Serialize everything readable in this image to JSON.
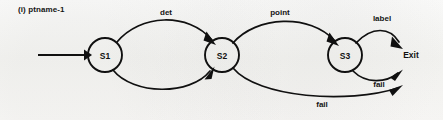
{
  "figure": {
    "caption": "(i) ptname-1",
    "background_color": "#fbfbf9",
    "ink_color": "#101010"
  },
  "diagram": {
    "type": "state-transition-diagram",
    "states": [
      {
        "id": "S1",
        "label": "S1",
        "cx": 105,
        "cy": 55,
        "r": 17
      },
      {
        "id": "S2",
        "label": "S2",
        "cx": 222,
        "cy": 55,
        "r": 17
      },
      {
        "id": "S3",
        "label": "S3",
        "cx": 345,
        "cy": 55,
        "r": 17
      }
    ],
    "terminals": [
      {
        "id": "Exit",
        "label": "Exit",
        "x": 411,
        "y": 58
      }
    ],
    "start_arrow": {
      "from_x": 38,
      "to_x": 86,
      "y": 55
    },
    "transitions": [
      {
        "id": "t1",
        "from": "S1",
        "to": "S2",
        "label": "det",
        "label_x": 166,
        "label_y": 15,
        "style": "arc-over"
      },
      {
        "id": "t2",
        "from": "S1",
        "to": "S2",
        "label": "",
        "label_x": 0,
        "label_y": 0,
        "style": "arc-under"
      },
      {
        "id": "t3",
        "from": "S2",
        "to": "S3",
        "label": "point",
        "label_x": 280,
        "label_y": 15,
        "style": "arc-over"
      },
      {
        "id": "t4",
        "from": "S3",
        "to": "Exit",
        "label": "label",
        "label_x": 382,
        "label_y": 21,
        "style": "arc-over"
      },
      {
        "id": "t5",
        "from": "S3",
        "to": "Exit",
        "label": "fail",
        "label_x": 379,
        "label_y": 87,
        "style": "arc-under"
      },
      {
        "id": "t6",
        "from": "S2",
        "to": "Exit",
        "label": "fail",
        "label_x": 322,
        "label_y": 107,
        "style": "long-arc-under"
      }
    ]
  }
}
